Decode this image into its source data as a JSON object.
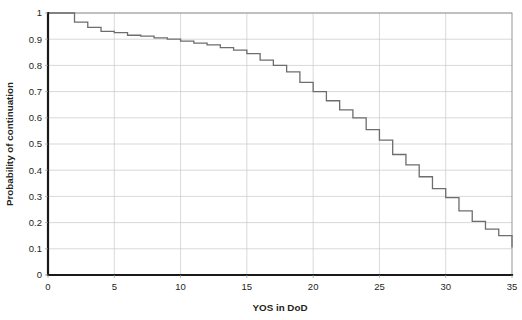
{
  "chart_data": {
    "type": "line",
    "subtype": "step-function",
    "title": "",
    "xlabel": "YOS in DoD",
    "ylabel": "Probability of continuation",
    "xlim": [
      0,
      35
    ],
    "ylim": [
      0,
      1
    ],
    "xticks": [
      0,
      5,
      10,
      15,
      20,
      25,
      30,
      35
    ],
    "xticklabels": [
      "0",
      "5",
      "10",
      "15",
      "20",
      "25",
      "30",
      "35"
    ],
    "yticks": [
      0,
      0.1,
      0.2,
      0.3,
      0.4,
      0.5,
      0.6,
      0.7,
      0.8,
      0.9,
      1
    ],
    "yticklabels": [
      "0",
      "0.1",
      "0.2",
      "0.3",
      "0.4",
      "0.5",
      "0.6",
      "0.7",
      "0.8",
      "0.9",
      "1"
    ],
    "grid": "horizontal-and-vertical",
    "legend": "none",
    "series": [
      {
        "name": "Probability of continuation",
        "color": "#6d6d6d",
        "x": [
          0,
          1,
          2,
          3,
          4,
          5,
          6,
          7,
          8,
          9,
          10,
          11,
          12,
          13,
          14,
          15,
          16,
          17,
          18,
          19,
          20,
          21,
          22,
          23,
          24,
          25,
          26,
          27,
          28,
          29,
          30,
          31,
          32,
          33,
          34,
          35
        ],
        "values": [
          1.0,
          1.0,
          0.965,
          0.945,
          0.93,
          0.925,
          0.915,
          0.912,
          0.905,
          0.9,
          0.893,
          0.885,
          0.878,
          0.868,
          0.858,
          0.845,
          0.82,
          0.8,
          0.775,
          0.735,
          0.7,
          0.665,
          0.63,
          0.6,
          0.555,
          0.515,
          0.46,
          0.42,
          0.375,
          0.33,
          0.295,
          0.245,
          0.205,
          0.175,
          0.15,
          0.105
        ]
      }
    ]
  },
  "axes": {
    "x_axis_title": "YOS in DoD",
    "y_axis_title": "Probability of continuation"
  },
  "colors": {
    "curve": "#6d6d6d",
    "grid": "#c9c9c9",
    "axis": "#1a1a1a",
    "border": "#8a8a8a",
    "text": "#231f20",
    "background": "#ffffff"
  }
}
